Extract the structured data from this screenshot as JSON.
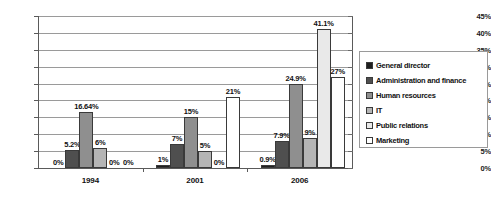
{
  "chart_data": {
    "type": "bar",
    "title": "",
    "subtitle": "",
    "xlabel": "",
    "ylabel": "",
    "categories": [
      "1994",
      "2001",
      "2006"
    ],
    "ylim": [
      0,
      45
    ],
    "y_tick_labels": [
      "0%",
      "5%",
      "10%",
      "15%",
      "20%",
      "25%",
      "30%",
      "35%",
      "40%",
      "45%"
    ],
    "y_tick_values": [
      0,
      5,
      10,
      15,
      20,
      25,
      30,
      35,
      40,
      45
    ],
    "grid": "horizontal",
    "legend_position": "right",
    "series": [
      {
        "name": "General director",
        "color": "#1f1f1f",
        "values": [
          0,
          1,
          0.9
        ],
        "labels": [
          "0%",
          "1%",
          "0.9%"
        ]
      },
      {
        "name": "Administration and finance",
        "color": "#4f4f4f",
        "values": [
          5.2,
          7,
          7.9
        ],
        "labels": [
          "5.2%",
          "7%",
          "7.9%"
        ]
      },
      {
        "name": "Human resources",
        "color": "#8f8f8f",
        "values": [
          16.64,
          15,
          24.9
        ],
        "labels": [
          "16.64%",
          "15%",
          "24.9%"
        ]
      },
      {
        "name": "IT",
        "color": "#b5b5b5",
        "values": [
          6,
          5,
          9
        ],
        "labels": [
          "6%",
          "5%",
          "9%"
        ]
      },
      {
        "name": "Public relations",
        "color": "#e9e9e9",
        "values": [
          0,
          0,
          41.1
        ],
        "labels": [
          "0%",
          "0%",
          "41.1%"
        ]
      },
      {
        "name": "Marketing",
        "color": "#ffffff",
        "values": [
          0,
          21,
          27
        ],
        "labels": [
          "0%",
          "21%",
          "27%"
        ]
      }
    ]
  },
  "legend": {
    "items": [
      {
        "label": "General director"
      },
      {
        "label": "Administration and finance"
      },
      {
        "label": "Human resources"
      },
      {
        "label": "IT"
      },
      {
        "label": "Public relations"
      },
      {
        "label": "Marketing"
      }
    ]
  },
  "axis": {
    "y_labels": [
      "45%",
      "40%",
      "35%",
      "30%",
      "25%",
      "20%",
      "15%",
      "10%",
      "5%",
      "0%"
    ],
    "x_labels": [
      "1994",
      "2001",
      "2006"
    ]
  }
}
